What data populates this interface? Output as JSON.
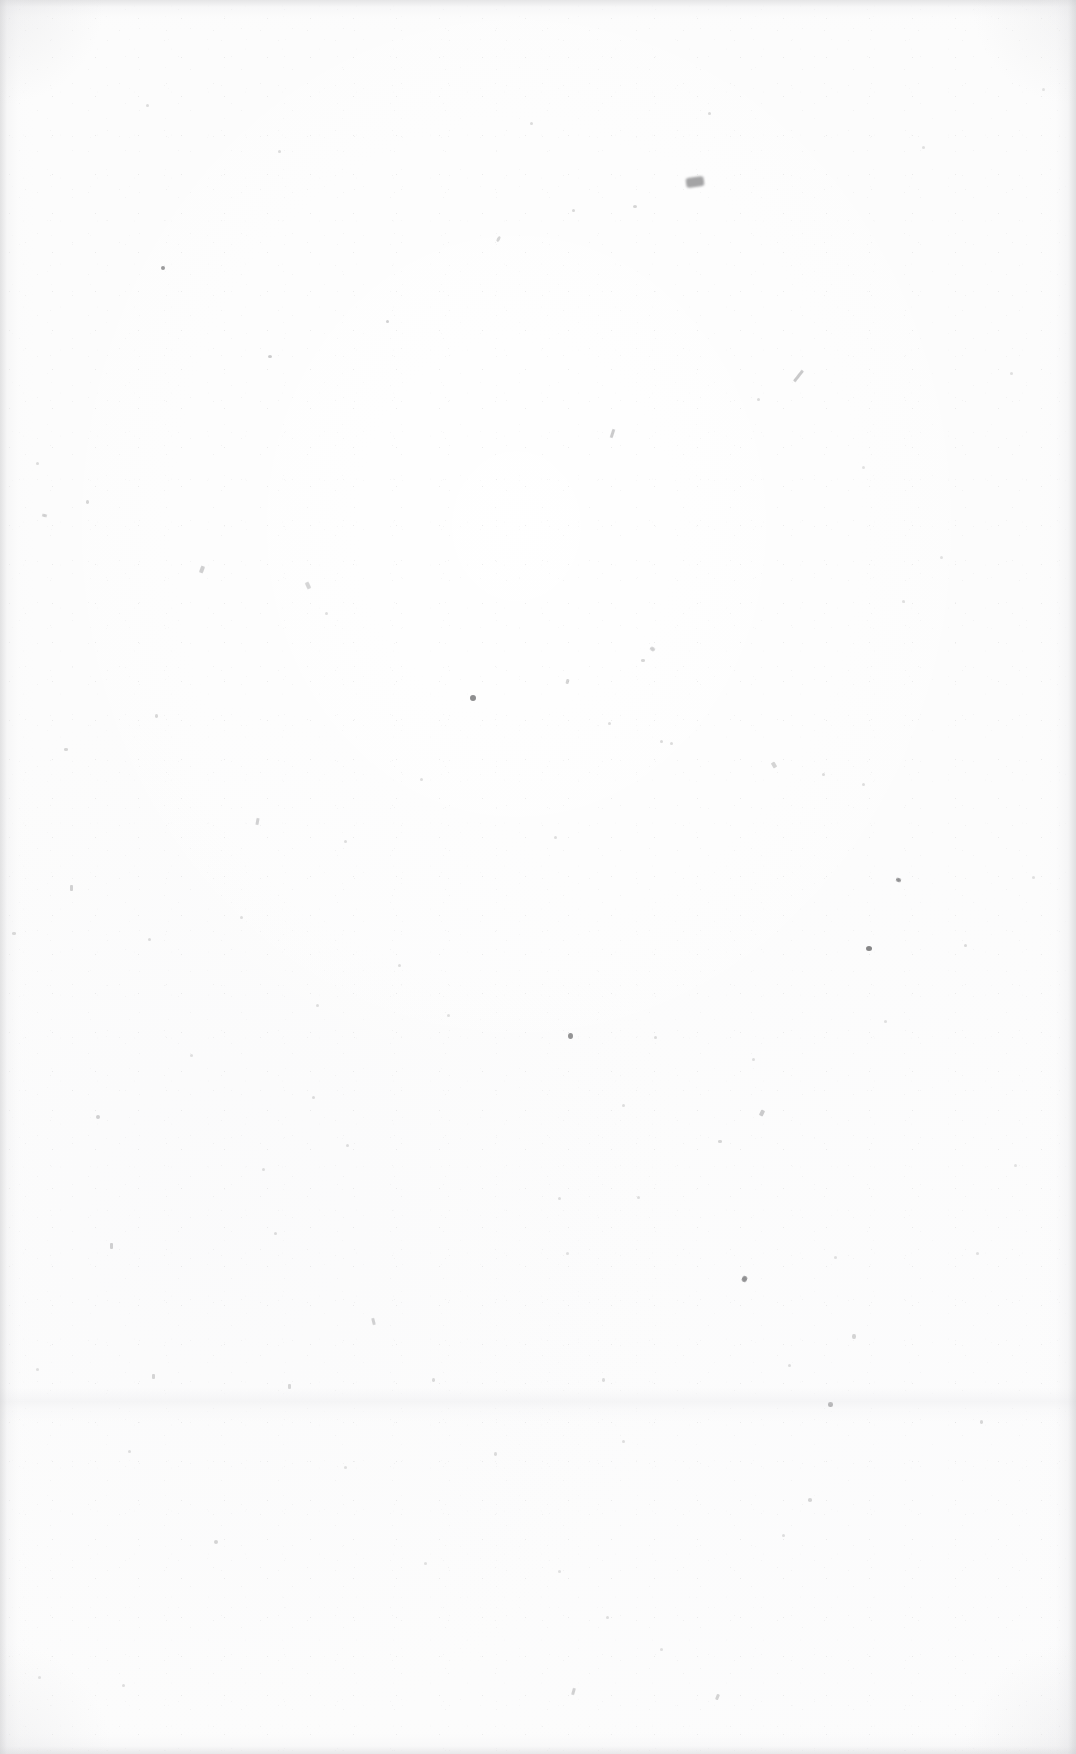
{
  "document": {
    "kind": "scanned-blank-page",
    "description": "Blank endpaper / flyleaf scanned from an aged book",
    "width_px": 1076,
    "height_px": 1754,
    "visible_text": "",
    "has_text": false,
    "has_illustration": false,
    "has_ruling": false
  },
  "appearance": {
    "paper_base_color": "#fcfcfc",
    "paper_highlight_color": "#ffffff",
    "speck_color": "#9a9a9c",
    "dark_speck_color": "#4a4a4c",
    "darkest_mark_color": "#6e6e70",
    "vignette_color": "#cdcdcf",
    "crease_color": "#eeeef0"
  },
  "edge_vignette": {
    "left_px": 34,
    "right_px": 40,
    "top_px": 32,
    "bottom_px": 36
  },
  "crease_band": {
    "top_px": 1388,
    "height_px": 34,
    "label": "faint horizontal scan crease"
  },
  "principal_mark": {
    "name": "dark-smudge",
    "x_px": 686,
    "y_px": 177,
    "width_px": 18,
    "height_px": 10,
    "color": "#6e6e70",
    "note": "most prominent blemish on the sheet, upper-centre-right"
  },
  "specks": [
    {
      "x": 686,
      "y": 177,
      "w": 18,
      "h": 10,
      "o": 0.62,
      "r": -8,
      "type": "smudge"
    },
    {
      "x": 161,
      "y": 266,
      "w": 4,
      "h": 4,
      "o": 0.55,
      "r": 0,
      "type": "speck"
    },
    {
      "x": 268,
      "y": 355,
      "w": 4,
      "h": 3,
      "o": 0.5,
      "r": 0,
      "type": "speck"
    },
    {
      "x": 386,
      "y": 320,
      "w": 3,
      "h": 3,
      "o": 0.45,
      "r": 0,
      "type": "speck"
    },
    {
      "x": 497,
      "y": 236,
      "w": 3,
      "h": 6,
      "o": 0.4,
      "r": 28,
      "type": "fleck"
    },
    {
      "x": 572,
      "y": 209,
      "w": 3,
      "h": 3,
      "o": 0.38,
      "r": 0,
      "type": "speck"
    },
    {
      "x": 633,
      "y": 205,
      "w": 4,
      "h": 3,
      "o": 0.42,
      "r": 0,
      "type": "speck"
    },
    {
      "x": 708,
      "y": 112,
      "w": 3,
      "h": 3,
      "o": 0.36,
      "r": 0,
      "type": "speck"
    },
    {
      "x": 530,
      "y": 122,
      "w": 3,
      "h": 3,
      "o": 0.34,
      "r": 0,
      "type": "speck"
    },
    {
      "x": 278,
      "y": 150,
      "w": 3,
      "h": 3,
      "o": 0.34,
      "r": 0,
      "type": "speck"
    },
    {
      "x": 146,
      "y": 104,
      "w": 3,
      "h": 3,
      "o": 0.33,
      "r": 0,
      "type": "speck"
    },
    {
      "x": 797,
      "y": 369,
      "w": 3,
      "h": 14,
      "o": 0.52,
      "r": 38,
      "type": "hairline"
    },
    {
      "x": 611,
      "y": 429,
      "w": 3,
      "h": 9,
      "o": 0.5,
      "r": 18,
      "type": "hairline"
    },
    {
      "x": 757,
      "y": 398,
      "w": 3,
      "h": 3,
      "o": 0.34,
      "r": 0,
      "type": "speck"
    },
    {
      "x": 42,
      "y": 514,
      "w": 5,
      "h": 3,
      "o": 0.46,
      "r": 12,
      "type": "fleck"
    },
    {
      "x": 86,
      "y": 500,
      "w": 3,
      "h": 4,
      "o": 0.4,
      "r": 0,
      "type": "fleck"
    },
    {
      "x": 36,
      "y": 462,
      "w": 3,
      "h": 3,
      "o": 0.34,
      "r": 0,
      "type": "speck"
    },
    {
      "x": 200,
      "y": 566,
      "w": 4,
      "h": 7,
      "o": 0.46,
      "r": 20,
      "type": "hairline"
    },
    {
      "x": 306,
      "y": 582,
      "w": 4,
      "h": 7,
      "o": 0.4,
      "r": -24,
      "type": "hairline"
    },
    {
      "x": 325,
      "y": 612,
      "w": 3,
      "h": 3,
      "o": 0.32,
      "r": 0,
      "type": "speck"
    },
    {
      "x": 650,
      "y": 647,
      "w": 5,
      "h": 4,
      "o": 0.46,
      "r": 30,
      "type": "fleck"
    },
    {
      "x": 641,
      "y": 659,
      "w": 4,
      "h": 3,
      "o": 0.4,
      "r": 0,
      "type": "fleck"
    },
    {
      "x": 470,
      "y": 695,
      "w": 6,
      "h": 6,
      "o": 0.62,
      "r": 0,
      "type": "speck"
    },
    {
      "x": 566,
      "y": 679,
      "w": 3,
      "h": 5,
      "o": 0.42,
      "r": 14,
      "type": "hairline"
    },
    {
      "x": 608,
      "y": 722,
      "w": 3,
      "h": 3,
      "o": 0.34,
      "r": 0,
      "type": "speck"
    },
    {
      "x": 660,
      "y": 740,
      "w": 3,
      "h": 3,
      "o": 0.36,
      "r": 0,
      "type": "speck"
    },
    {
      "x": 670,
      "y": 742,
      "w": 3,
      "h": 3,
      "o": 0.34,
      "r": 0,
      "type": "speck"
    },
    {
      "x": 155,
      "y": 714,
      "w": 3,
      "h": 4,
      "o": 0.38,
      "r": 0,
      "type": "fleck"
    },
    {
      "x": 64,
      "y": 748,
      "w": 4,
      "h": 3,
      "o": 0.4,
      "r": 0,
      "type": "fleck"
    },
    {
      "x": 256,
      "y": 818,
      "w": 3,
      "h": 7,
      "o": 0.44,
      "r": 10,
      "type": "hairline"
    },
    {
      "x": 344,
      "y": 840,
      "w": 3,
      "h": 3,
      "o": 0.32,
      "r": 0,
      "type": "speck"
    },
    {
      "x": 420,
      "y": 778,
      "w": 3,
      "h": 3,
      "o": 0.32,
      "r": 0,
      "type": "speck"
    },
    {
      "x": 554,
      "y": 836,
      "w": 3,
      "h": 3,
      "o": 0.32,
      "r": 0,
      "type": "speck"
    },
    {
      "x": 772,
      "y": 762,
      "w": 4,
      "h": 6,
      "o": 0.42,
      "r": -30,
      "type": "hairline"
    },
    {
      "x": 822,
      "y": 773,
      "w": 3,
      "h": 3,
      "o": 0.34,
      "r": 0,
      "type": "speck"
    },
    {
      "x": 862,
      "y": 783,
      "w": 3,
      "h": 3,
      "o": 0.32,
      "r": 0,
      "type": "speck"
    },
    {
      "x": 866,
      "y": 946,
      "w": 6,
      "h": 5,
      "o": 0.66,
      "r": 0,
      "type": "speck"
    },
    {
      "x": 896,
      "y": 878,
      "w": 5,
      "h": 4,
      "o": 0.6,
      "r": 20,
      "type": "fleck"
    },
    {
      "x": 964,
      "y": 944,
      "w": 3,
      "h": 3,
      "o": 0.36,
      "r": 0,
      "type": "speck"
    },
    {
      "x": 70,
      "y": 885,
      "w": 3,
      "h": 6,
      "o": 0.44,
      "r": 0,
      "type": "hairline"
    },
    {
      "x": 148,
      "y": 938,
      "w": 3,
      "h": 3,
      "o": 0.34,
      "r": 0,
      "type": "speck"
    },
    {
      "x": 240,
      "y": 916,
      "w": 3,
      "h": 3,
      "o": 0.32,
      "r": 0,
      "type": "speck"
    },
    {
      "x": 12,
      "y": 932,
      "w": 4,
      "h": 3,
      "o": 0.42,
      "r": 0,
      "type": "fleck"
    },
    {
      "x": 568,
      "y": 1033,
      "w": 5,
      "h": 6,
      "o": 0.58,
      "r": 0,
      "type": "speck"
    },
    {
      "x": 654,
      "y": 1036,
      "w": 3,
      "h": 3,
      "o": 0.34,
      "r": 0,
      "type": "speck"
    },
    {
      "x": 316,
      "y": 1004,
      "w": 3,
      "h": 3,
      "o": 0.32,
      "r": 0,
      "type": "speck"
    },
    {
      "x": 398,
      "y": 964,
      "w": 3,
      "h": 3,
      "o": 0.32,
      "r": 0,
      "type": "speck"
    },
    {
      "x": 447,
      "y": 1014,
      "w": 3,
      "h": 3,
      "o": 0.3,
      "r": 0,
      "type": "speck"
    },
    {
      "x": 752,
      "y": 1058,
      "w": 3,
      "h": 3,
      "o": 0.32,
      "r": 0,
      "type": "speck"
    },
    {
      "x": 884,
      "y": 1020,
      "w": 3,
      "h": 3,
      "o": 0.3,
      "r": 0,
      "type": "speck"
    },
    {
      "x": 96,
      "y": 1115,
      "w": 4,
      "h": 4,
      "o": 0.46,
      "r": 0,
      "type": "speck"
    },
    {
      "x": 312,
      "y": 1096,
      "w": 3,
      "h": 3,
      "o": 0.34,
      "r": 0,
      "type": "speck"
    },
    {
      "x": 346,
      "y": 1144,
      "w": 3,
      "h": 3,
      "o": 0.32,
      "r": 0,
      "type": "speck"
    },
    {
      "x": 622,
      "y": 1104,
      "w": 3,
      "h": 3,
      "o": 0.32,
      "r": 0,
      "type": "speck"
    },
    {
      "x": 718,
      "y": 1140,
      "w": 4,
      "h": 3,
      "o": 0.4,
      "r": 0,
      "type": "fleck"
    },
    {
      "x": 760,
      "y": 1110,
      "w": 4,
      "h": 6,
      "o": 0.5,
      "r": 26,
      "type": "hairline"
    },
    {
      "x": 110,
      "y": 1243,
      "w": 3,
      "h": 6,
      "o": 0.46,
      "r": 0,
      "type": "hairline"
    },
    {
      "x": 274,
      "y": 1232,
      "w": 3,
      "h": 3,
      "o": 0.34,
      "r": 0,
      "type": "speck"
    },
    {
      "x": 372,
      "y": 1318,
      "w": 3,
      "h": 7,
      "o": 0.44,
      "r": -14,
      "type": "hairline"
    },
    {
      "x": 558,
      "y": 1197,
      "w": 3,
      "h": 3,
      "o": 0.32,
      "r": 0,
      "type": "speck"
    },
    {
      "x": 566,
      "y": 1252,
      "w": 3,
      "h": 3,
      "o": 0.3,
      "r": 0,
      "type": "speck"
    },
    {
      "x": 742,
      "y": 1276,
      "w": 5,
      "h": 6,
      "o": 0.6,
      "r": 24,
      "type": "fleck"
    },
    {
      "x": 637,
      "y": 1196,
      "w": 3,
      "h": 3,
      "o": 0.32,
      "r": 0,
      "type": "speck"
    },
    {
      "x": 834,
      "y": 1256,
      "w": 3,
      "h": 3,
      "o": 0.3,
      "r": 0,
      "type": "speck"
    },
    {
      "x": 852,
      "y": 1334,
      "w": 4,
      "h": 5,
      "o": 0.42,
      "r": 0,
      "type": "fleck"
    },
    {
      "x": 788,
      "y": 1364,
      "w": 3,
      "h": 3,
      "o": 0.32,
      "r": 0,
      "type": "speck"
    },
    {
      "x": 828,
      "y": 1402,
      "w": 5,
      "h": 5,
      "o": 0.62,
      "r": 0,
      "type": "fleck"
    },
    {
      "x": 980,
      "y": 1420,
      "w": 3,
      "h": 4,
      "o": 0.38,
      "r": 0,
      "type": "fleck"
    },
    {
      "x": 152,
      "y": 1374,
      "w": 3,
      "h": 5,
      "o": 0.4,
      "r": 0,
      "type": "hairline"
    },
    {
      "x": 288,
      "y": 1384,
      "w": 3,
      "h": 5,
      "o": 0.38,
      "r": 0,
      "type": "hairline"
    },
    {
      "x": 432,
      "y": 1378,
      "w": 3,
      "h": 4,
      "o": 0.36,
      "r": 0,
      "type": "fleck"
    },
    {
      "x": 602,
      "y": 1378,
      "w": 3,
      "h": 4,
      "o": 0.34,
      "r": 0,
      "type": "fleck"
    },
    {
      "x": 128,
      "y": 1450,
      "w": 3,
      "h": 3,
      "o": 0.32,
      "r": 0,
      "type": "speck"
    },
    {
      "x": 344,
      "y": 1466,
      "w": 3,
      "h": 3,
      "o": 0.3,
      "r": 0,
      "type": "speck"
    },
    {
      "x": 494,
      "y": 1452,
      "w": 3,
      "h": 4,
      "o": 0.34,
      "r": 0,
      "type": "fleck"
    },
    {
      "x": 622,
      "y": 1440,
      "w": 3,
      "h": 3,
      "o": 0.32,
      "r": 0,
      "type": "speck"
    },
    {
      "x": 808,
      "y": 1498,
      "w": 4,
      "h": 4,
      "o": 0.4,
      "r": 0,
      "type": "fleck"
    },
    {
      "x": 782,
      "y": 1534,
      "w": 3,
      "h": 3,
      "o": 0.32,
      "r": 0,
      "type": "speck"
    },
    {
      "x": 214,
      "y": 1540,
      "w": 4,
      "h": 4,
      "o": 0.42,
      "r": 0,
      "type": "speck"
    },
    {
      "x": 424,
      "y": 1562,
      "w": 3,
      "h": 3,
      "o": 0.3,
      "r": 0,
      "type": "speck"
    },
    {
      "x": 558,
      "y": 1570,
      "w": 3,
      "h": 3,
      "o": 0.3,
      "r": 0,
      "type": "speck"
    },
    {
      "x": 606,
      "y": 1616,
      "w": 3,
      "h": 3,
      "o": 0.32,
      "r": 0,
      "type": "speck"
    },
    {
      "x": 660,
      "y": 1648,
      "w": 3,
      "h": 3,
      "o": 0.3,
      "r": 0,
      "type": "speck"
    },
    {
      "x": 716,
      "y": 1694,
      "w": 3,
      "h": 6,
      "o": 0.42,
      "r": 22,
      "type": "hairline"
    },
    {
      "x": 572,
      "y": 1688,
      "w": 3,
      "h": 7,
      "o": 0.44,
      "r": 16,
      "type": "hairline"
    },
    {
      "x": 122,
      "y": 1684,
      "w": 3,
      "h": 3,
      "o": 0.32,
      "r": 0,
      "type": "speck"
    },
    {
      "x": 38,
      "y": 1676,
      "w": 3,
      "h": 3,
      "o": 0.3,
      "r": 0,
      "type": "speck"
    },
    {
      "x": 190,
      "y": 1054,
      "w": 3,
      "h": 3,
      "o": 0.3,
      "r": 0,
      "type": "speck"
    },
    {
      "x": 262,
      "y": 1168,
      "w": 3,
      "h": 3,
      "o": 0.32,
      "r": 0,
      "type": "speck"
    },
    {
      "x": 36,
      "y": 1368,
      "w": 3,
      "h": 3,
      "o": 0.3,
      "r": 0,
      "type": "speck"
    },
    {
      "x": 976,
      "y": 1252,
      "w": 3,
      "h": 3,
      "o": 0.3,
      "r": 0,
      "type": "speck"
    },
    {
      "x": 1032,
      "y": 876,
      "w": 3,
      "h": 3,
      "o": 0.3,
      "r": 0,
      "type": "speck"
    },
    {
      "x": 1014,
      "y": 1164,
      "w": 3,
      "h": 3,
      "o": 0.28,
      "r": 0,
      "type": "speck"
    },
    {
      "x": 902,
      "y": 600,
      "w": 3,
      "h": 3,
      "o": 0.3,
      "r": 0,
      "type": "speck"
    },
    {
      "x": 940,
      "y": 556,
      "w": 3,
      "h": 3,
      "o": 0.28,
      "r": 0,
      "type": "speck"
    },
    {
      "x": 862,
      "y": 466,
      "w": 3,
      "h": 3,
      "o": 0.28,
      "r": 0,
      "type": "speck"
    },
    {
      "x": 1010,
      "y": 372,
      "w": 3,
      "h": 3,
      "o": 0.3,
      "r": 0,
      "type": "speck"
    },
    {
      "x": 922,
      "y": 146,
      "w": 3,
      "h": 3,
      "o": 0.3,
      "r": 0,
      "type": "speck"
    },
    {
      "x": 1042,
      "y": 88,
      "w": 3,
      "h": 3,
      "o": 0.28,
      "r": 0,
      "type": "speck"
    }
  ]
}
